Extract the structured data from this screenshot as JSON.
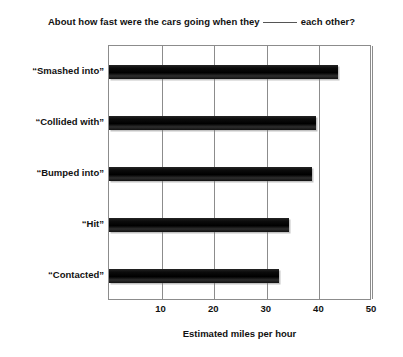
{
  "chart_data": {
    "type": "bar",
    "orientation": "horizontal",
    "title_prefix": "About how fast were the cars going when they",
    "title_blank": "_____",
    "title_suffix": "each other?",
    "categories": [
      "“Smashed into”",
      "“Collided with”",
      "“Bumped into”",
      "“Hit”",
      "“Contacted”"
    ],
    "values": [
      43.5,
      39.4,
      38.6,
      34.2,
      32.3
    ],
    "xlabel": "Estimated miles per hour",
    "ylabel": "",
    "xlim": [
      0,
      50
    ],
    "xticks": [
      0,
      10,
      20,
      30,
      40,
      50
    ],
    "xtick_labels": [
      "",
      "10",
      "20",
      "30",
      "40",
      "50"
    ],
    "grid": true,
    "legend": false,
    "bar_color": "#111111",
    "frame_color": "#8c8c8c",
    "background": "#ffffff"
  }
}
